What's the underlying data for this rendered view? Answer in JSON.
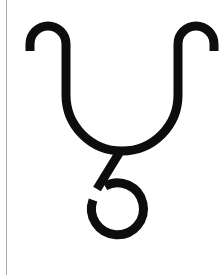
{
  "page": {
    "width": 221,
    "height": 275,
    "background_color": "#ffffff",
    "margin_rule": {
      "name": "margin-rule",
      "color": "#9a9a9a",
      "x": 6,
      "width": 1
    }
  },
  "glyph": {
    "label": "hooked-u-with-loop-tail-glyph",
    "description": "U-shaped stroke with outward curling hooks at both upper ends, a diagonal tail descending from the base into an open circular loop",
    "ink_color": "#0d0d0d",
    "stroke_width": 9,
    "strokes": [
      {
        "name": "u-body-with-hooks",
        "path": "M 30 51 L 30 44 A 18 18 0 0 1 66 44 L 66 95 A 45 45 0 0 0 178 95 L 178 44 A 18 18 0 0 1 214 44 L 214 51"
      },
      {
        "name": "diagonal-tail",
        "path": "M 121 150 L 97 189"
      },
      {
        "name": "open-loop",
        "path": "M 93 200 A 26 26 0 1 0 105 186"
      }
    ],
    "bounds": {
      "left": 26,
      "top": 28,
      "right": 215,
      "bottom": 246
    }
  }
}
